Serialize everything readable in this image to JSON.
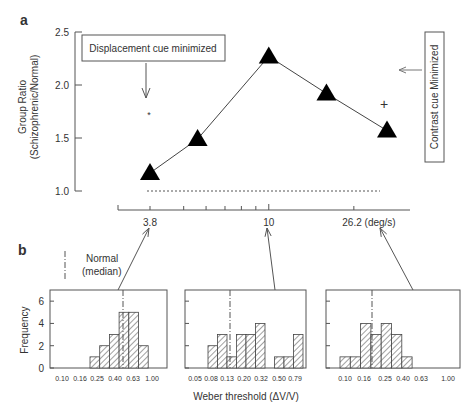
{
  "chart_data": [
    {
      "panel": "a",
      "type": "line",
      "ylabel": "Group Ratio",
      "ylabel2": "(Schizophrenic/Normal)",
      "ylim": [
        1.0,
        2.5
      ],
      "yticks": [
        "1.0",
        "1.5",
        "2.0",
        "2.5"
      ],
      "xscale": "log",
      "xtick_labels": [
        "3.8",
        "10",
        "26.2 (deg/s)"
      ],
      "xtick_values": [
        3.8,
        10,
        26.2
      ],
      "x": [
        3.8,
        5.6,
        10,
        16,
        26.2
      ],
      "y": [
        1.17,
        1.49,
        2.27,
        1.92,
        1.57
      ],
      "reference_line": 1.0,
      "displacement_point": {
        "x": 3.8,
        "y": 1.75,
        "marker": "*"
      },
      "contrast_point": {
        "x": 26.2,
        "y": 1.82,
        "marker": "+"
      },
      "annotations": [
        "Displacement cue minimized",
        "Contrast cue Minimized"
      ]
    },
    {
      "panel": "b-left",
      "type": "bar",
      "ylabel": "Frequency",
      "yticks": [
        "0",
        "2",
        "4",
        "6"
      ],
      "xtick_labels": [
        "0.10",
        "0.16",
        "0.25",
        "0.40",
        "0.63",
        "1.00"
      ],
      "values": [
        1,
        2,
        3,
        5,
        5,
        2
      ],
      "median_label": "Normal (median)"
    },
    {
      "panel": "b-middle",
      "type": "bar",
      "xlabel": "Weber threshold (ΔV/V)",
      "xtick_labels": [
        "0.05",
        "0.08",
        "0.13",
        "0.20",
        "0.32",
        "0.50",
        "0.79"
      ],
      "values": [
        2,
        3,
        1,
        3,
        3,
        4,
        0,
        1,
        1,
        3
      ]
    },
    {
      "panel": "b-right",
      "type": "bar",
      "xtick_labels": [
        "0.10",
        "0.16",
        "0.25",
        "0.40",
        "0.63",
        "1.00"
      ],
      "values": [
        1,
        1,
        4,
        3,
        4,
        3,
        1
      ]
    }
  ],
  "labels": {
    "panel_a": "a",
    "panel_b": "b",
    "legend_normal": "Normal",
    "legend_median": "(median)"
  }
}
